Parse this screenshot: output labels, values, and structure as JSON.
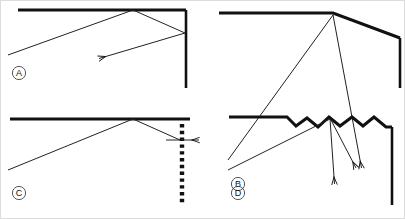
{
  "figure": {
    "background_color": "#ffffff",
    "ink_color": "#111111",
    "width": 405,
    "height": 219,
    "border": {
      "present": true,
      "color": "#dcdcdc"
    }
  },
  "panels": [
    {
      "id": "A",
      "label": "A",
      "caption": "Flat mirror with flat vertical wall - specular double reflection back to the left",
      "surface_type": "flat-smooth",
      "elements": {
        "mirror_label": "flat horizontal mirror",
        "wall_label": "flat vertical wall",
        "incident_ray_label": "incident ray",
        "reflected_ray_label": "reflected ray",
        "exit_ray_label": "exit ray with arrow"
      }
    },
    {
      "id": "B",
      "label": "B",
      "caption": "Bent mirror - single reflection downward to the right",
      "surface_type": "bent-smooth",
      "elements": {
        "mirror_label": "bent horizontal mirror",
        "wall_label": "flat vertical wall",
        "incident_ray_label": "incident ray",
        "reflected_ray_label": "reflected ray with arrow"
      }
    },
    {
      "id": "C",
      "label": "C",
      "caption": "Flat mirror with dashed vertical boundary - ray exits horizontally to the right",
      "surface_type": "flat-smooth",
      "elements": {
        "mirror_label": "flat horizontal mirror",
        "wall_label": "dashed vertical boundary",
        "incident_ray_label": "incident ray",
        "reflected_ray_label": "reflected ray",
        "exit_ray_label": "exit ray with arrow"
      }
    },
    {
      "id": "D",
      "label": "D",
      "caption": "Rough zigzag surface - diffuse scattering into two rays",
      "surface_type": "rough-zigzag",
      "elements": {
        "mirror_label": "rough zigzag surface",
        "wall_label": "flat vertical wall",
        "incident_ray_label": "incident ray",
        "scattered_ray_1_label": "scattered ray with arrow",
        "scattered_ray_2_label": "scattered ray with arrow"
      }
    }
  ],
  "geometry": {
    "panel_a": {
      "mirror": "M 18 10 L 186 10",
      "wall": "M 186 10 L 186 88",
      "incident": "M 8 55 L 133 10",
      "reflected": "M 133 10 L 185 33",
      "exit": "M 185 33 L 97 59",
      "arrow_tip": [
        97,
        59
      ],
      "label_pos": [
        19,
        73
      ]
    },
    "panel_b": {
      "mirror": "M 219 13 L 333 13 L 400 38",
      "wall": "M 400 38 L 400 88",
      "incident": "M 228 160 L 333 14",
      "reflected": "M 333 14 L 363 172",
      "arrow_tip": [
        363,
        172
      ],
      "label_pos": [
        238,
        184
      ]
    },
    "panel_c": {
      "mirror": "M 10 119 L 190 119",
      "dashed_wall": "M 182 117 L 182 205",
      "incident": "M 8 170 L 133 119",
      "reflected": "M 133 119 L 180 140",
      "exit": "M 168 140 L 201 140",
      "arrow_tip": [
        201,
        140
      ],
      "label_pos": [
        19,
        193
      ]
    },
    "panel_d": {
      "rough_surface": "M 229 117 L 287 117 L 296 126 L 307 118 L 318 127 L 329 117 L 340 126 L 352 117 L 363 126 L 374 117 L 386 127 L 392 127",
      "wall": "M 392 127 L 392 205",
      "incident": "M 228 170 L 330 119",
      "scattered_1": "M 330 119 L 335 188",
      "scattered_2": "M 331 120 L 358 172",
      "arrow_tips": [
        [
          335,
          188
        ],
        [
          358,
          172
        ]
      ],
      "label_pos": [
        238,
        193
      ]
    }
  }
}
